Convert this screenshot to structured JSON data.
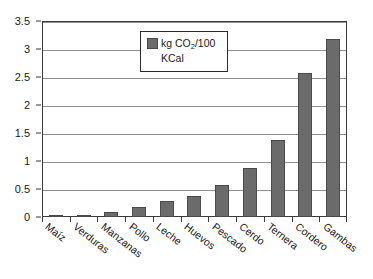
{
  "chart_data": {
    "type": "bar",
    "title": "",
    "subtitle": "",
    "xlabel": "",
    "ylabel": "",
    "ylim": [
      0,
      3.5
    ],
    "ytick_labels": [
      "0",
      "0.5",
      "1",
      "1.5",
      "2",
      "2.5",
      "3",
      "3.5"
    ],
    "ytick_values": [
      0,
      0.5,
      1,
      1.5,
      2,
      2.5,
      3,
      3.5
    ],
    "grid": true,
    "legend_position": "top-center",
    "legend": [
      {
        "label_line1_prefix": "kg CO",
        "label_line1_sub": "2",
        "label_line1_suffix": "/100",
        "label_line2": "KCal",
        "color": "#6b6b6b"
      }
    ],
    "categories": [
      "Maíz",
      "Verduras",
      "Manzanas",
      "Pollo",
      "Leche",
      "Huevos",
      "Pescado",
      "Cerdo",
      "Ternera",
      "Cordero",
      "Gambas"
    ],
    "values": [
      0.04,
      0.04,
      0.09,
      0.18,
      0.28,
      0.38,
      0.58,
      0.88,
      1.37,
      2.57,
      3.17
    ],
    "series": [
      {
        "name": "kg CO2/100 KCal",
        "color": "#6b6b6b",
        "values": [
          0.04,
          0.04,
          0.09,
          0.18,
          0.28,
          0.38,
          0.58,
          0.88,
          1.37,
          2.57,
          3.17
        ]
      }
    ],
    "colors": {
      "bar_fill": "#6b6b6b",
      "bar_border": "#4a4a4a",
      "gridline": "#8f8f8f",
      "frame": "#3b3b3b",
      "text": "#1a1a1a",
      "background": "#ffffff"
    }
  }
}
